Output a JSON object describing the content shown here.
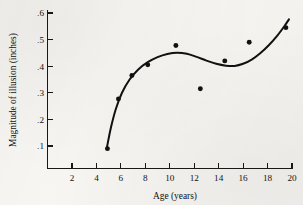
{
  "chart_data": {
    "type": "scatter",
    "title": "",
    "xlabel": "Age (years)",
    "ylabel": "Magnitude of illusion (inches)",
    "xlim": [
      0,
      20.6
    ],
    "ylim": [
      0.0,
      0.63
    ],
    "grid": false,
    "legend": null,
    "x_ticks": [
      2,
      4,
      6,
      8,
      10,
      12,
      14,
      16,
      18,
      20
    ],
    "x_tick_labels": [
      "2",
      "4",
      "6",
      "8",
      "10",
      "12",
      "14",
      "16",
      "18",
      "20"
    ],
    "y_ticks": [
      0.1,
      0.2,
      0.3,
      0.4,
      0.5,
      0.6
    ],
    "y_tick_labels": [
      ".1",
      ".2",
      ".3",
      ".4",
      ".5",
      ".6"
    ],
    "points": [
      {
        "x": 4.9,
        "y": 0.09
      },
      {
        "x": 5.8,
        "y": 0.277
      },
      {
        "x": 6.9,
        "y": 0.365
      },
      {
        "x": 8.2,
        "y": 0.405
      },
      {
        "x": 10.5,
        "y": 0.478
      },
      {
        "x": 12.5,
        "y": 0.315
      },
      {
        "x": 14.5,
        "y": 0.42
      },
      {
        "x": 16.5,
        "y": 0.49
      },
      {
        "x": 19.5,
        "y": 0.545
      }
    ],
    "fit_curve": [
      {
        "x": 4.85,
        "y": 0.093
      },
      {
        "x": 5.2,
        "y": 0.172
      },
      {
        "x": 5.6,
        "y": 0.241
      },
      {
        "x": 6.1,
        "y": 0.301
      },
      {
        "x": 6.7,
        "y": 0.349
      },
      {
        "x": 7.4,
        "y": 0.387
      },
      {
        "x": 8.2,
        "y": 0.415
      },
      {
        "x": 9.0,
        "y": 0.434
      },
      {
        "x": 9.8,
        "y": 0.446
      },
      {
        "x": 10.6,
        "y": 0.451
      },
      {
        "x": 11.4,
        "y": 0.447
      },
      {
        "x": 12.2,
        "y": 0.435
      },
      {
        "x": 13.0,
        "y": 0.421
      },
      {
        "x": 13.8,
        "y": 0.409
      },
      {
        "x": 14.6,
        "y": 0.402
      },
      {
        "x": 15.3,
        "y": 0.401
      },
      {
        "x": 16.0,
        "y": 0.409
      },
      {
        "x": 16.7,
        "y": 0.425
      },
      {
        "x": 17.4,
        "y": 0.449
      },
      {
        "x": 18.1,
        "y": 0.479
      },
      {
        "x": 18.8,
        "y": 0.515
      },
      {
        "x": 19.4,
        "y": 0.552
      },
      {
        "x": 19.75,
        "y": 0.576
      }
    ]
  }
}
